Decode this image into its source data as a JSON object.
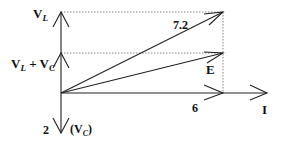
{
  "diagram": {
    "type": "phasor-diagram",
    "labels": {
      "vl": {
        "main": "V",
        "sub": "L"
      },
      "vlvc": {
        "main1": "V",
        "sub1": "L",
        "plus": " + ",
        "main2": "V",
        "sub2": "C"
      },
      "vc_value": "2",
      "vc": {
        "open": "(",
        "main": "V",
        "sub": "C",
        "close": ")"
      },
      "resultant_value": "7.2",
      "e": "E",
      "i_value": "6",
      "i": "I"
    },
    "colors": {
      "stroke": "#222222",
      "dotted": "#666666",
      "text": "#111111"
    }
  }
}
